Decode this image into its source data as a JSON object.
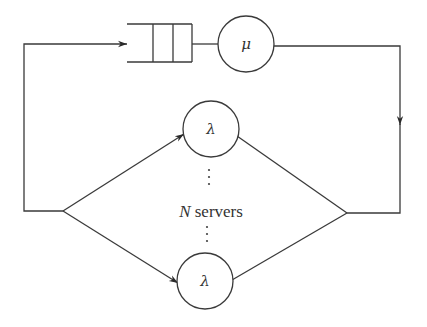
{
  "diagram": {
    "type": "closed queueing network",
    "queue": {
      "slots": 3,
      "server_symbol": "μ"
    },
    "servers": {
      "top_symbol": "λ",
      "bottom_symbol": "λ",
      "count_label_var": "N",
      "count_label_text": " servers"
    },
    "colors": {
      "line": "#3a3a3a",
      "text": "#333333",
      "background": "#ffffff"
    }
  }
}
